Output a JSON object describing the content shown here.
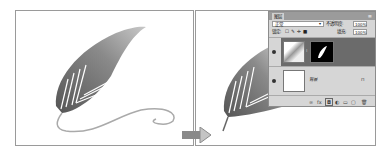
{
  "arrow": {
    "icon": "right-arrow-icon",
    "color": "#8a8a8a"
  },
  "layers_panel": {
    "tab_label": "图层",
    "menu_icon": "panel-menu-icon",
    "blend_mode": "正常",
    "opacity_label": "不透明度:",
    "opacity_value": "100%",
    "lock_label": "锁定:",
    "lock_icons": [
      "lock-transparent-icon",
      "lock-image-icon",
      "lock-position-icon",
      "lock-all-icon"
    ],
    "fill_label": "填充:",
    "fill_value": "100%",
    "layers": [
      {
        "name": "",
        "selected": true,
        "has_mask": true,
        "visible": true
      },
      {
        "name": "背景",
        "selected": false,
        "locked": true,
        "visible": true
      }
    ],
    "lock_glyph": "🔒",
    "bottom_icons": [
      "link-icon",
      "fx-icon",
      "add-mask-icon",
      "adjustment-icon",
      "group-icon",
      "new-layer-icon",
      "delete-icon"
    ],
    "bottom_glyphs": [
      "∞",
      "fx",
      "◘",
      "◐",
      "▭",
      "▢",
      "🗑"
    ]
  }
}
